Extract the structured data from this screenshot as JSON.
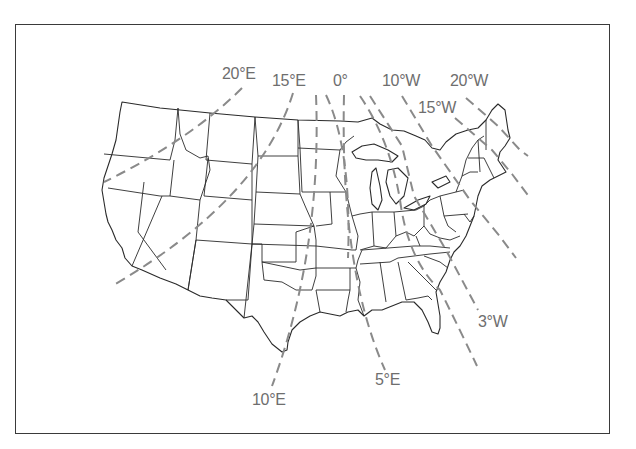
{
  "map": {
    "subject": "Contiguous United States with isogonic lines (magnetic declination)",
    "colors": {
      "frame": "#3a3a3a",
      "state_lines": "#2a2a2a",
      "isogonic_lines": "#8a8a8a",
      "labels": "#6e6e6e"
    },
    "isogonic_labels": [
      {
        "id": "20E",
        "text": "20°E",
        "x": 222,
        "y": 65
      },
      {
        "id": "15E",
        "text": "15°E",
        "x": 272,
        "y": 72
      },
      {
        "id": "0",
        "text": "0°",
        "x": 333,
        "y": 72
      },
      {
        "id": "10W",
        "text": "10°W",
        "x": 382,
        "y": 72
      },
      {
        "id": "20W",
        "text": "20°W",
        "x": 450,
        "y": 72
      },
      {
        "id": "15W",
        "text": "15°W",
        "x": 418,
        "y": 99
      },
      {
        "id": "3W",
        "text": "3°W",
        "x": 478,
        "y": 313
      },
      {
        "id": "5E",
        "text": "5°E",
        "x": 375,
        "y": 371
      },
      {
        "id": "10E",
        "text": "10°E",
        "x": 252,
        "y": 391
      }
    ]
  }
}
